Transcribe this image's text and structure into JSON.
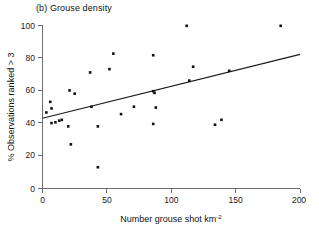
{
  "figure": {
    "panel_label": "(b)",
    "panel_title": "(b)  Grouse density"
  },
  "chart_data": {
    "type": "scatter",
    "title": "(b)  Grouse density",
    "xlabel": "Number grouse shot km",
    "xlabel_superscript": "-2",
    "ylabel": "% Observations ranked > 3",
    "xlim": [
      0,
      200
    ],
    "ylim": [
      0,
      100
    ],
    "xticks": [
      0,
      50,
      100,
      150,
      200
    ],
    "yticks": [
      0,
      20,
      40,
      60,
      80,
      100
    ],
    "xtick_labels": [
      "0",
      "50",
      "100",
      "150",
      "200"
    ],
    "ytick_labels": [
      "0",
      "20",
      "40",
      "60",
      "80",
      "100"
    ],
    "grid": false,
    "legend": "none",
    "marker": "square",
    "marker_color": "#111111",
    "points": [
      {
        "x": 3,
        "y": 46.5
      },
      {
        "x": 6,
        "y": 53.0
      },
      {
        "x": 7,
        "y": 49.0
      },
      {
        "x": 7,
        "y": 40.0
      },
      {
        "x": 10,
        "y": 40.5
      },
      {
        "x": 13,
        "y": 41.5
      },
      {
        "x": 15,
        "y": 42.0
      },
      {
        "x": 20,
        "y": 38.0
      },
      {
        "x": 21,
        "y": 60.0
      },
      {
        "x": 22,
        "y": 27.0
      },
      {
        "x": 25,
        "y": 58.0
      },
      {
        "x": 37,
        "y": 71.0
      },
      {
        "x": 38,
        "y": 50.0
      },
      {
        "x": 43,
        "y": 38.0
      },
      {
        "x": 43,
        "y": 13.0
      },
      {
        "x": 52,
        "y": 73.0
      },
      {
        "x": 55,
        "y": 82.5
      },
      {
        "x": 61,
        "y": 45.5
      },
      {
        "x": 71,
        "y": 50.0
      },
      {
        "x": 86,
        "y": 81.5
      },
      {
        "x": 86,
        "y": 59.5
      },
      {
        "x": 87,
        "y": 58.5
      },
      {
        "x": 86,
        "y": 39.5
      },
      {
        "x": 88,
        "y": 49.5
      },
      {
        "x": 112,
        "y": 99.5
      },
      {
        "x": 114,
        "y": 66.0
      },
      {
        "x": 117,
        "y": 74.5
      },
      {
        "x": 134,
        "y": 39.0
      },
      {
        "x": 139,
        "y": 42.0
      },
      {
        "x": 145,
        "y": 72.0
      },
      {
        "x": 185,
        "y": 99.5
      }
    ],
    "fit_line": {
      "type": "linear-regression",
      "x_start": 0,
      "y_start": 43.0,
      "x_end": 200,
      "y_end": 82.0
    }
  }
}
